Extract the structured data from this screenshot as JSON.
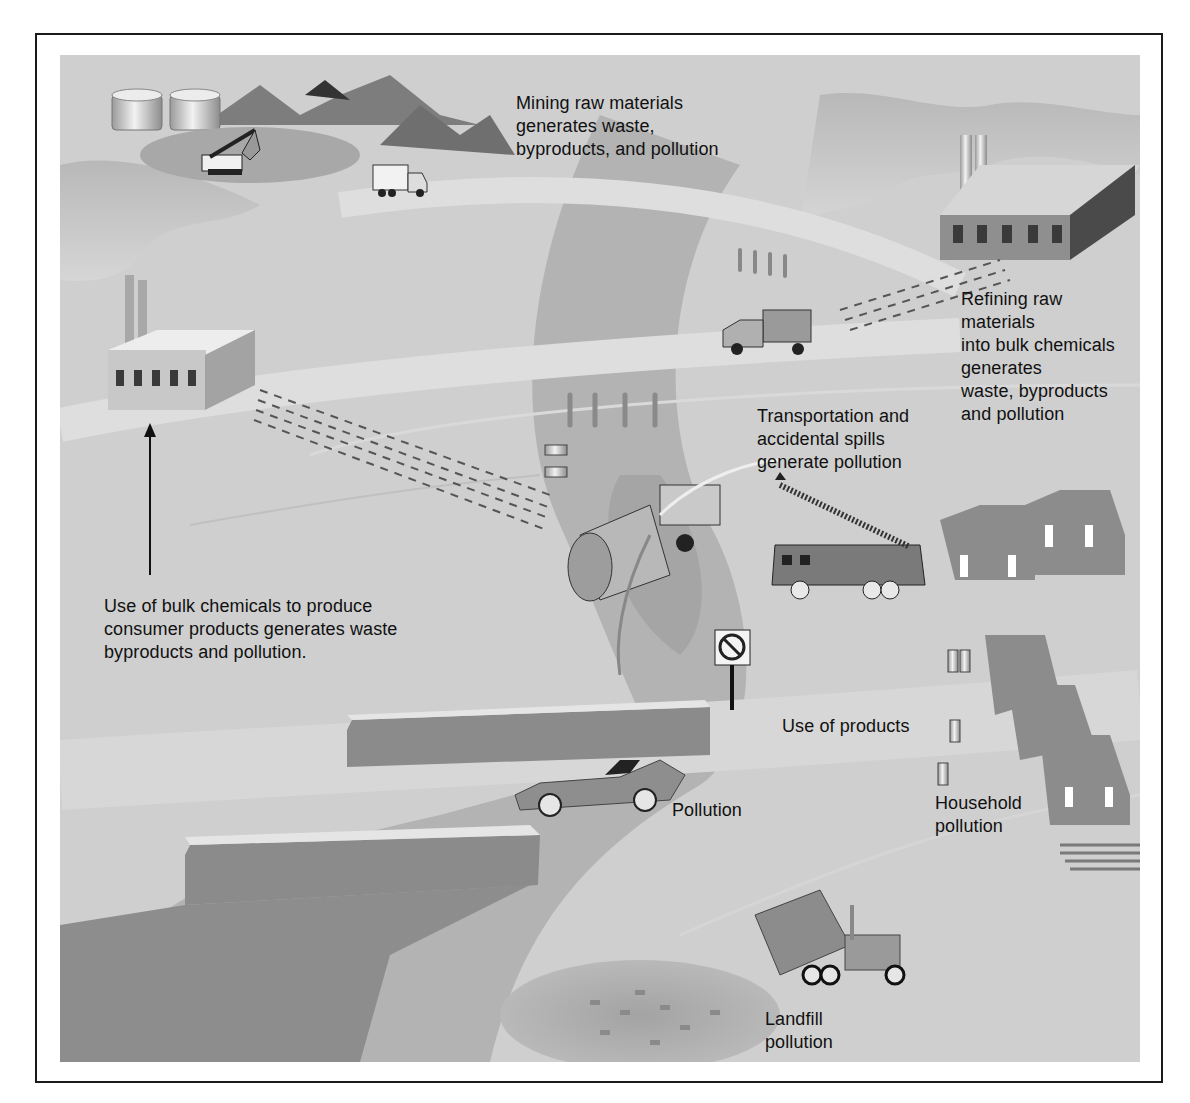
{
  "figure": {
    "labels": {
      "mining": "Mining raw materials\ngenerates waste,\nbyproducts, and pollution",
      "refining": "Refining raw\nmaterials\ninto bulk chemicals\ngenerates\nwaste, byproducts\nand pollution",
      "transportation": "Transportation and\naccidental spills\ngenerate pollution",
      "manufacturing": "Use of bulk chemicals to produce\nconsumer products generates waste\nbyproducts and pollution.",
      "use_of_products": "Use of products",
      "pollution": "Pollution",
      "household": "Household\npollution",
      "landfill": "Landfill\npollution"
    },
    "sign_text": "NO LITTERING",
    "colors": {
      "background": "#cfcfcf",
      "road": "#dcdcdc",
      "river": "#a9a9a9",
      "buildings": "#8a8a8a",
      "dark": "#3c3c3c",
      "text": "#111111"
    }
  }
}
